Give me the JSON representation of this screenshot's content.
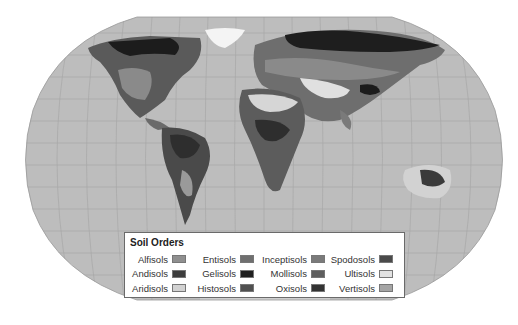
{
  "map": {
    "projection": "robinson",
    "ocean_color": "#bdbdbd",
    "grid_color": "#a9a9a9"
  },
  "legend": {
    "title": "Soil Orders",
    "items": [
      {
        "label": "Alfisols",
        "color": "#8f8f8f"
      },
      {
        "label": "Entisols",
        "color": "#6f6f6f"
      },
      {
        "label": "Inceptisols",
        "color": "#7a7a7a"
      },
      {
        "label": "Spodosols",
        "color": "#4a4a4a"
      },
      {
        "label": "Andisols",
        "color": "#3d3d3d"
      },
      {
        "label": "Gelisols",
        "color": "#1f1f1f"
      },
      {
        "label": "Mollisols",
        "color": "#5e5e5e"
      },
      {
        "label": "Ultisols",
        "color": "#e2e2e2"
      },
      {
        "label": "Aridisols",
        "color": "#d2d2d2"
      },
      {
        "label": "Histosols",
        "color": "#505050"
      },
      {
        "label": "Oxisols",
        "color": "#333333"
      },
      {
        "label": "Vertisols",
        "color": "#a5a5a5"
      }
    ]
  }
}
